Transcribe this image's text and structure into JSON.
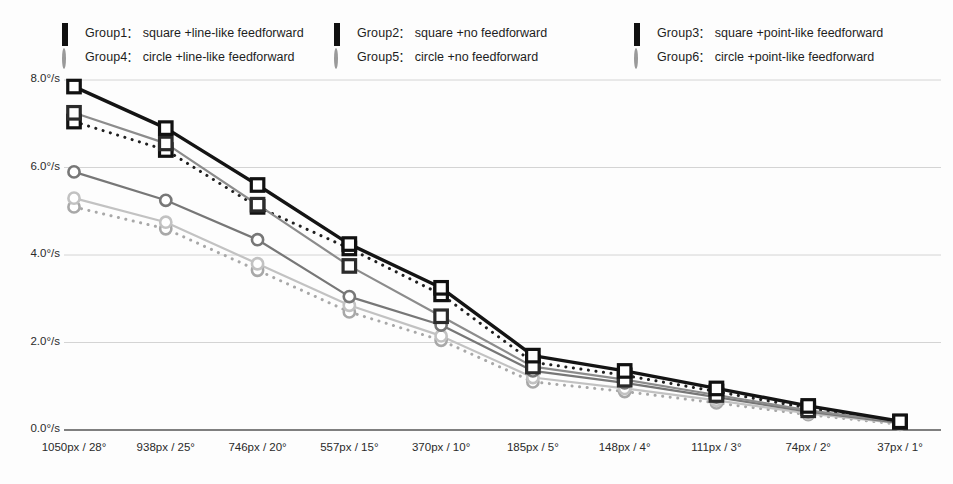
{
  "legend": {
    "items": [
      {
        "name": "Group1",
        "colon": ":",
        "desc": "square +line-like feedforward",
        "marker": "square",
        "col": 1,
        "row": 1
      },
      {
        "name": "Group2",
        "colon": ":",
        "desc": "square +no feedforward",
        "marker": "square",
        "col": 2,
        "row": 1
      },
      {
        "name": "Group3",
        "colon": ":",
        "desc": "square +point-like feedforward",
        "marker": "square",
        "col": 3,
        "row": 1
      },
      {
        "name": "Group4",
        "colon": ":",
        "desc": "circle +line-like feedforward",
        "marker": "circle",
        "col": 1,
        "row": 2
      },
      {
        "name": "Group5",
        "colon": ":",
        "desc": "circle +no feedforward",
        "marker": "circle",
        "col": 2,
        "row": 2
      },
      {
        "name": "Group6",
        "colon": ":",
        "desc": "circle +point-like feedforward",
        "marker": "circle",
        "col": 3,
        "row": 2
      }
    ]
  },
  "chart_data": {
    "type": "line",
    "title": "",
    "xlabel": "",
    "ylabel": "",
    "ylim": [
      0.0,
      8.0
    ],
    "yticks": [
      0.0,
      2.0,
      4.0,
      6.0,
      8.0
    ],
    "ytick_labels": [
      "0.0°/s",
      "2.0°/s",
      "4.0°/s",
      "6.0°/s",
      "8.0°/s"
    ],
    "grid": true,
    "legend_position": "top",
    "categories": [
      "1050px / 28°",
      "938px / 25°",
      "746px / 20°",
      "557px / 15°",
      "370px / 10°",
      "185px / 5°",
      "148px / 4°",
      "111px / 3°",
      "74px / 2°",
      "37px / 1°"
    ],
    "series": [
      {
        "name": "Group1",
        "label": "square +line-like feedforward",
        "marker": "square",
        "style": "solid-thick",
        "color": "#141414",
        "values": [
          7.85,
          6.9,
          5.6,
          4.25,
          3.25,
          1.7,
          1.35,
          0.95,
          0.55,
          0.2
        ]
      },
      {
        "name": "Group2",
        "label": "square +no feedforward",
        "marker": "square",
        "style": "solid",
        "color": "#8c8c8c",
        "values": [
          7.25,
          6.55,
          5.15,
          3.75,
          2.6,
          1.45,
          1.15,
          0.8,
          0.45,
          0.18
        ]
      },
      {
        "name": "Group3",
        "label": "square +point-like feedforward",
        "marker": "square",
        "style": "dotted",
        "color": "#1f1f1f",
        "values": [
          7.05,
          6.4,
          5.1,
          4.15,
          3.1,
          1.55,
          1.25,
          0.88,
          0.5,
          0.18
        ]
      },
      {
        "name": "Group4",
        "label": "circle +line-like feedforward",
        "marker": "circle",
        "style": "solid",
        "color": "#777777",
        "values": [
          5.9,
          5.25,
          4.35,
          3.05,
          2.4,
          1.35,
          1.08,
          0.75,
          0.42,
          0.16
        ]
      },
      {
        "name": "Group5",
        "label": "circle +no feedforward",
        "marker": "circle",
        "style": "solid",
        "color": "#c2c2c2",
        "values": [
          5.3,
          4.75,
          3.8,
          2.85,
          2.15,
          1.2,
          0.95,
          0.68,
          0.38,
          0.15
        ]
      },
      {
        "name": "Group6",
        "label": "circle +point-like feedforward",
        "marker": "circle",
        "style": "dotted",
        "color": "#a8a8a8",
        "values": [
          5.1,
          4.6,
          3.65,
          2.7,
          2.05,
          1.1,
          0.88,
          0.62,
          0.35,
          0.13
        ]
      }
    ]
  }
}
